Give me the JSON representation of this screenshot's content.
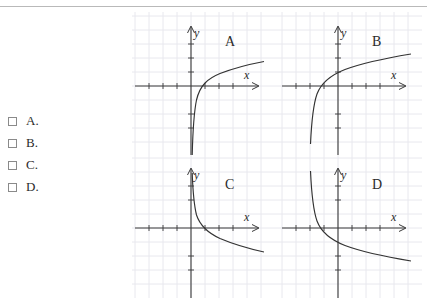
{
  "page": {
    "rule_color": "#b9b9b9",
    "background": "#ffffff",
    "ink_color": "#2b2b2b",
    "grid_color": "#e8e8ee"
  },
  "options": {
    "items": [
      {
        "label": "A.",
        "checked": false
      },
      {
        "label": "B.",
        "checked": false
      },
      {
        "label": "C.",
        "checked": false
      },
      {
        "label": "D.",
        "checked": false
      }
    ]
  },
  "graphs": {
    "axis_labels": {
      "x": "x",
      "y": "y"
    },
    "panels": [
      {
        "letter": "A",
        "description": "increasing logarithmic curve, vertical asymptote at x = 0, x-intercept at x = 1",
        "asymptote_x": 0,
        "x_intercept": 1,
        "direction": "increasing",
        "shift": 0
      },
      {
        "letter": "B",
        "description": "increasing logarithmic curve shifted left, vertical asymptote left of y-axis, x-intercept left of origin",
        "asymptote_x": -1.6,
        "x_intercept": -0.7,
        "direction": "increasing",
        "shift": -1.6
      },
      {
        "letter": "C",
        "description": "decreasing logarithmic curve, vertical asymptote at x = 0, x-intercept at x = 1",
        "asymptote_x": 0,
        "x_intercept": 1,
        "direction": "decreasing",
        "shift": 0
      },
      {
        "letter": "D",
        "description": "decreasing logarithmic curve shifted left, vertical asymptote left of y-axis, x-intercept left of origin",
        "asymptote_x": -1.6,
        "x_intercept": -0.7,
        "direction": "decreasing",
        "shift": -1.6
      }
    ]
  }
}
